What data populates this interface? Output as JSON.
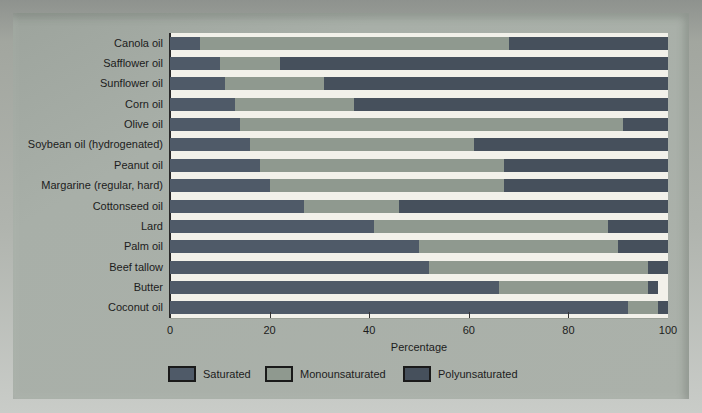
{
  "figure": {
    "xlabel": "Percentage",
    "xticks": [
      "0",
      "20",
      "40",
      "60",
      "80",
      "100"
    ]
  },
  "chart_data": {
    "type": "bar",
    "orientation": "horizontal",
    "stacked": true,
    "title": "",
    "xlabel": "Percentage",
    "ylabel": "",
    "xlim": [
      0,
      100
    ],
    "xtick_values": [
      0,
      20,
      40,
      60,
      80,
      100
    ],
    "grid": false,
    "legend_position": "bottom",
    "categories": [
      "Canola oil",
      "Safflower oil",
      "Sunflower oil",
      "Corn oil",
      "Olive oil",
      "Soybean oil (hydrogenated)",
      "Peanut oil",
      "Margarine (regular, hard)",
      "Cottonseed oil",
      "Lard",
      "Palm oil",
      "Beef tallow",
      "Butter",
      "Coconut oil"
    ],
    "series": [
      {
        "name": "Saturated",
        "color": "#4f5a68",
        "values": [
          6,
          10,
          11,
          13,
          14,
          16,
          18,
          20,
          27,
          41,
          50,
          52,
          66,
          92
        ]
      },
      {
        "name": "Monounsaturated",
        "color": "#8f998f",
        "values": [
          62,
          12,
          20,
          24,
          77,
          45,
          49,
          47,
          19,
          47,
          40,
          44,
          30,
          6
        ]
      },
      {
        "name": "Polyunsaturated",
        "color": "#46505c",
        "values": [
          32,
          78,
          69,
          63,
          9,
          39,
          33,
          33,
          54,
          12,
          10,
          4,
          2,
          2
        ]
      }
    ],
    "colors": {
      "panel_background": "#a8afa8",
      "plot_background": "#f2f1ea",
      "axis_line": "#2a2a2a"
    }
  }
}
